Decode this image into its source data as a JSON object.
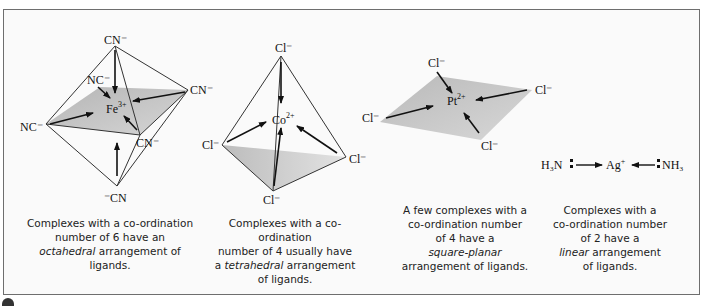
{
  "figure": {
    "panels": [
      {
        "id": "octahedral",
        "metal": {
          "symbol": "Fe",
          "charge": "3+"
        },
        "ligands": [
          "CN",
          "NC",
          "CN",
          "NC",
          "CN",
          "CN"
        ],
        "ligand_labels": {
          "top": "CN⁻",
          "upper_left": "NC⁻",
          "right": "CN⁻",
          "left": "NC⁻",
          "front": "CN⁻",
          "bottom": "⁻CN"
        },
        "caption_parts": {
          "line1": "Complexes with a co-ordination",
          "line2": "number of 6 have an",
          "italic": "octahedral",
          "line3_rest": " arrangement of",
          "line4": "ligands."
        }
      },
      {
        "id": "tetrahedral",
        "metal": {
          "symbol": "Co",
          "charge": "2+"
        },
        "ligand_labels": {
          "top": "Cl⁻",
          "left": "Cl⁻",
          "right": "Cl⁻",
          "bottom": "Cl⁻"
        },
        "caption_parts": {
          "line1": "Complexes with a co-ordination",
          "line2": "number of 4 usually have",
          "line3_pre": "a ",
          "italic": "tetrahedral",
          "line3_rest": " arrangement",
          "line4": "of ligands."
        }
      },
      {
        "id": "square-planar",
        "metal": {
          "symbol": "Pt",
          "charge": "2+"
        },
        "ligand_labels": {
          "top": "Cl⁻",
          "right": "Cl⁻",
          "left": "Cl⁻",
          "bottom": "Cl⁻"
        },
        "caption_parts": {
          "line1": "A few complexes with a",
          "line2": "co-ordination number",
          "line3": "of 4 have a",
          "italic": "square-planar",
          "line5": "arrangement of ligands."
        }
      },
      {
        "id": "linear",
        "metal": {
          "symbol": "Ag",
          "charge": "+"
        },
        "ligand_labels": {
          "left": "H₃N",
          "right": "NH₃"
        },
        "caption_parts": {
          "line1": "Complexes with a",
          "line2": "co-ordination number",
          "line3": "of 2 have a",
          "italic": "linear",
          "line4_rest": " arrangement",
          "line5": "of ligands."
        }
      }
    ],
    "colors": {
      "border": "#6e6e6e",
      "background": "#fafafa",
      "plane_shade": "#bdbdbd",
      "text": "#111111"
    }
  }
}
